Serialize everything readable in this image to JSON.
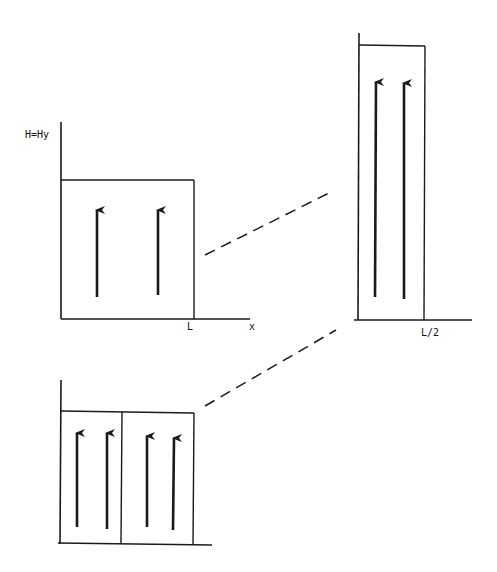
{
  "figure": {
    "colors": {
      "ink": "#1a1a1a",
      "background": "#ffffff"
    }
  },
  "panels": {
    "single_domain": {
      "y_axis_label": "H=Hy",
      "x_axis_label": "x",
      "x_tick_label": "L",
      "arrow_count": 2,
      "arrow_direction": "up"
    },
    "half_width_domain": {
      "x_tick_label": "L/2",
      "arrow_count": 2,
      "arrow_direction": "up"
    },
    "split_domains": {
      "sub_domain_count": 2,
      "arrows_per_sub_domain": 2,
      "arrow_direction": "up"
    }
  },
  "connectors": {
    "style": "dashed",
    "count": 2
  }
}
